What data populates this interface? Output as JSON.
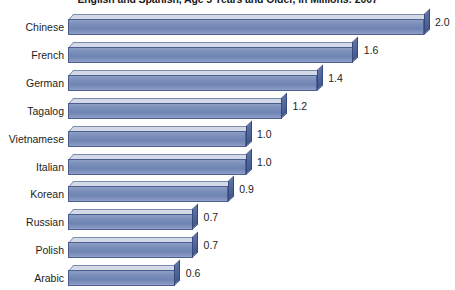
{
  "chart_data": {
    "type": "bar",
    "orientation": "horizontal",
    "title": "English and Spanish, Age 5 Years and Older, in Millions: 2007",
    "xlabel": "",
    "ylabel": "",
    "xlim": [
      0,
      2.2
    ],
    "grid": false,
    "legend": null,
    "value_format": "one-decimal",
    "units": "millions",
    "categories": [
      "Chinese",
      "French",
      "German",
      "Tagalog",
      "Vietnamese",
      "Italian",
      "Korean",
      "Russian",
      "Polish",
      "Arabic"
    ],
    "values": [
      2.0,
      1.6,
      1.4,
      1.2,
      1.0,
      1.0,
      0.9,
      0.7,
      0.7,
      0.6
    ],
    "value_labels": [
      "2.0",
      "1.6",
      "1.4",
      "1.2",
      "1.0",
      "1.0",
      "0.9",
      "0.7",
      "0.7",
      "0.6"
    ]
  },
  "style": {
    "bar_front_color": "#7b8fba",
    "bar_top_color": "#d3d9e6",
    "bar_cap_color": "#4a5f94",
    "bar_outline_color": "#4c5f91",
    "background_color": "#ffffff",
    "text_color": "#1d1d1d"
  }
}
